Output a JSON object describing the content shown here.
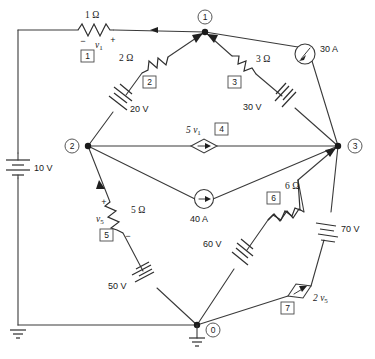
{
  "figure": {
    "type": "electrical-circuit-schematic",
    "title": "",
    "width": 375,
    "height": 359,
    "background_color": "#ffffff",
    "line_color": "#3a3a3a"
  },
  "nodes": [
    {
      "id": "n1",
      "label": "1",
      "x": 205,
      "y": 32,
      "circle_x": 205,
      "circle_y": 17,
      "grounded": false
    },
    {
      "id": "n2",
      "label": "2",
      "x": 88,
      "y": 146,
      "circle_x": 72,
      "circle_y": 146,
      "grounded": false
    },
    {
      "id": "n3",
      "label": "3",
      "x": 338,
      "y": 146,
      "circle_x": 355,
      "circle_y": 146,
      "grounded": false
    },
    {
      "id": "n0",
      "label": "0",
      "x": 197,
      "y": 325,
      "circle_x": 213,
      "circle_y": 330,
      "grounded": true
    }
  ],
  "elements": [
    {
      "box": "1",
      "kind": "resistor",
      "value": "1 Ω",
      "variable": "v",
      "variable_sub": "1",
      "polarity_minus": "−",
      "polarity_plus": "+",
      "orientation": "horizontal"
    },
    {
      "box": "2",
      "kind": "resistor",
      "value": "2 Ω",
      "orientation": "diagonal"
    },
    {
      "box": "3",
      "kind": "resistor",
      "value": "3 Ω",
      "orientation": "diagonal"
    },
    {
      "box": "4",
      "kind": "dependent-current-source",
      "value": "5 v",
      "value_sub": "1",
      "orientation": "horizontal"
    },
    {
      "box": "5",
      "kind": "resistor",
      "value": "5 Ω",
      "variable": "v",
      "variable_sub": "5",
      "polarity_plus": "+",
      "polarity_minus": "−",
      "orientation": "diagonal"
    },
    {
      "box": "6",
      "kind": "resistor",
      "value": "6 Ω",
      "orientation": "diagonal"
    },
    {
      "box": "7",
      "kind": "dependent-current-source",
      "value": "2 v",
      "value_sub": "5",
      "orientation": "diagonal"
    }
  ],
  "sources": [
    {
      "id": "src-10v",
      "kind": "voltage-source-battery",
      "value": "10 V",
      "orientation": "vertical"
    },
    {
      "id": "src-20v",
      "kind": "voltage-source-battery",
      "value": "20 V",
      "orientation": "diagonal"
    },
    {
      "id": "src-30v",
      "kind": "voltage-source-battery",
      "value": "30 V",
      "orientation": "diagonal"
    },
    {
      "id": "src-50v",
      "kind": "voltage-source-battery",
      "value": "50 V",
      "orientation": "diagonal"
    },
    {
      "id": "src-60v",
      "kind": "voltage-source-battery",
      "value": "60 V",
      "orientation": "diagonal"
    },
    {
      "id": "src-70v",
      "kind": "voltage-source-battery",
      "value": "70 V",
      "orientation": "diagonal"
    },
    {
      "id": "src-30a",
      "kind": "current-source-circle",
      "value": "30 A",
      "orientation": "diagonal"
    },
    {
      "id": "src-40a",
      "kind": "current-source-circle",
      "value": "40 A",
      "orientation": "horizontal"
    }
  ],
  "labels": {
    "r1_value": "1 Ω",
    "r1_var": "v",
    "r1_var_sub": "1",
    "r1_minus": "−",
    "r1_plus": "+",
    "r2_value": "2 Ω",
    "r3_value": "3 Ω",
    "r5_value": "5 Ω",
    "r5_var": "v",
    "r5_var_sub": "5",
    "r5_plus": "+",
    "r5_minus": "−",
    "r6_value": "6 Ω",
    "dep4_value": "5 v",
    "dep4_sub": "1",
    "dep7_value": "2 v",
    "dep7_sub": "5",
    "v10": "10 V",
    "v20": "20 V",
    "v30": "30 V",
    "v50": "50 V",
    "v60": "60 V",
    "v70": "70 V",
    "i30": "30 A",
    "i40": "40 A",
    "box1": "1",
    "box2": "2",
    "box3": "3",
    "box4": "4",
    "box5": "5",
    "box6": "6",
    "box7": "7",
    "node0": "0",
    "node1": "1",
    "node2": "2",
    "node3": "3"
  }
}
